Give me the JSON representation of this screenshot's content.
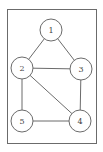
{
  "diagram": {
    "type": "undirected-graph",
    "frame": {
      "x": 7,
      "y": 9,
      "width": 89,
      "height": 134,
      "stroke": "#6b6b6b"
    },
    "node_radius": 11,
    "colors": {
      "stroke": "#6b6b6b",
      "fill": "#ffffff",
      "text": "#444444"
    },
    "nodes": [
      {
        "id": "1",
        "label": "1",
        "x": 51,
        "y": 30
      },
      {
        "id": "2",
        "label": "2",
        "x": 22,
        "y": 68
      },
      {
        "id": "3",
        "label": "3",
        "x": 81,
        "y": 69
      },
      {
        "id": "4",
        "label": "4",
        "x": 80,
        "y": 121
      },
      {
        "id": "5",
        "label": "5",
        "x": 22,
        "y": 121
      }
    ],
    "edges": [
      {
        "from": "1",
        "to": "2"
      },
      {
        "from": "1",
        "to": "3"
      },
      {
        "from": "2",
        "to": "3"
      },
      {
        "from": "2",
        "to": "5"
      },
      {
        "from": "2",
        "to": "4"
      },
      {
        "from": "3",
        "to": "4"
      },
      {
        "from": "5",
        "to": "4"
      }
    ]
  }
}
